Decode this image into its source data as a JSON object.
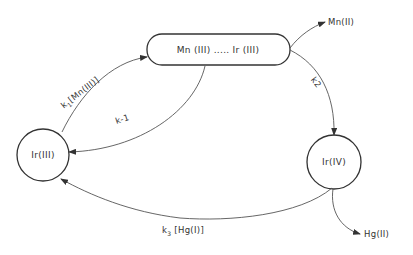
{
  "diagram": {
    "type": "reaction-cycle",
    "nodes": {
      "complex": {
        "label": "Mn (III) ..... Ir (III)",
        "shape": "rounded-rect"
      },
      "ir3": {
        "label": "Ir(III)",
        "shape": "circle"
      },
      "ir4": {
        "label": "Ir(IV)",
        "shape": "circle"
      },
      "mn2": {
        "label": "Mn(II)",
        "shape": "text"
      },
      "hg2": {
        "label": "Hg(II)",
        "shape": "text"
      }
    },
    "edges": [
      {
        "from": "ir3",
        "to": "complex",
        "label_k": "k",
        "label_sub": "1",
        "label_rest": "[Mn(III)]"
      },
      {
        "from": "complex",
        "to": "ir3",
        "label": "k-1"
      },
      {
        "from": "complex",
        "to": "ir4",
        "label": "k2"
      },
      {
        "from": "complex",
        "to": "mn2",
        "label": ""
      },
      {
        "from": "ir4",
        "to": "ir3",
        "label_k": "k",
        "label_sub": "3",
        "label_rest": " [Hg(I)]"
      },
      {
        "from": "ir4",
        "to": "hg2",
        "label": ""
      }
    ]
  },
  "colors": {
    "stroke": "#333333",
    "background": "#ffffff"
  }
}
